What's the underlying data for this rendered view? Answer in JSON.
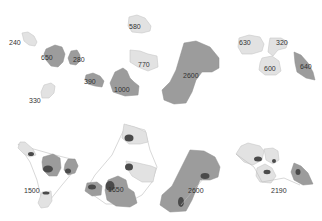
{
  "diagram": {
    "colors": {
      "light": "#e2e2e2",
      "medium": "#9c9c9c",
      "dark": "#8a8a8a",
      "blob": "#4a4a4a",
      "hull": "#bdbdbd"
    },
    "top_row": {
      "cluster_left": {
        "labels": [
          "240",
          "650",
          "280",
          "390",
          "330"
        ]
      },
      "cluster_center": {
        "labels": [
          "580",
          "770",
          "1000",
          "2600"
        ]
      },
      "cluster_right": {
        "labels": [
          "630",
          "320",
          "600",
          "640"
        ]
      }
    },
    "bottom_row": {
      "panel_1": {
        "label": "1500"
      },
      "panel_2": {
        "label": "1650"
      },
      "panel_3": {
        "label": "2600"
      },
      "panel_4": {
        "label": "2190"
      }
    }
  }
}
